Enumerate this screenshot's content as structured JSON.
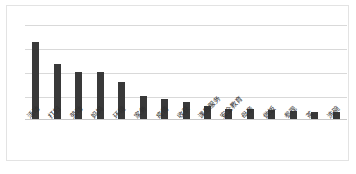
{
  "chart_data": {
    "type": "bar",
    "title": "",
    "subtitle": "",
    "xlabel": "",
    "ylabel": "",
    "grid": true,
    "legend": false,
    "legend_position": "none",
    "orientation": "vertical",
    "bar_color": "#393939",
    "gridline_color": "#d9d9d9",
    "border_color": "#e3e3e3",
    "background": "#ffffff",
    "ylim": [
      0,
      100
    ],
    "yticks": [
      0,
      20,
      40,
      60,
      80,
      100
    ],
    "ytick_labels": [
      "",
      "",
      "",
      "",
      "",
      ""
    ],
    "categories": [
      "活动",
      "打扫",
      "劳动",
      "妈妈",
      "环境",
      "家务",
      "疫情",
      "收获",
      "课后服务",
      "安全教育",
      "母亲",
      "做饭",
      "参观",
      "茶",
      "洗碗"
    ],
    "values": [
      81,
      58,
      49,
      49,
      39,
      24,
      21,
      18,
      14,
      11,
      11,
      10,
      8,
      7,
      7
    ],
    "annotations": []
  }
}
